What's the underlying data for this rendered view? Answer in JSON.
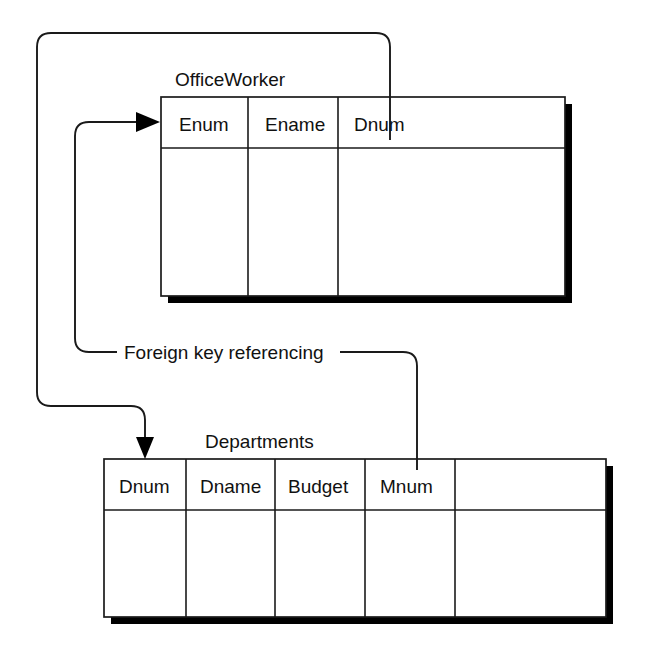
{
  "diagram": {
    "type": "relational-schema",
    "label_text": "Foreign key referencing",
    "line_color": "#1a1a1a",
    "shadow_color": "#000000",
    "background_color": "#ffffff"
  },
  "tables": [
    {
      "id": "officeworker",
      "name": "OfficeWorker",
      "columns": [
        {
          "name": "Enum",
          "is_key": true,
          "is_empty": false
        },
        {
          "name": "Ename",
          "is_key": false,
          "is_empty": false
        },
        {
          "name": "Dnum",
          "is_key": false,
          "is_empty": false
        }
      ]
    },
    {
      "id": "departments",
      "name": "Departments",
      "columns": [
        {
          "name": "Dnum",
          "is_key": true,
          "is_empty": false
        },
        {
          "name": "Dname",
          "is_key": false,
          "is_empty": false
        },
        {
          "name": "Budget",
          "is_key": false,
          "is_empty": false
        },
        {
          "name": "Mnum",
          "is_key": false,
          "is_empty": false
        },
        {
          "name": "",
          "is_key": false,
          "is_empty": true
        }
      ]
    }
  ],
  "relationships": [
    {
      "id": "dnum-fk",
      "from_table": "OfficeWorker",
      "from_column": "Dnum",
      "to_table": "Departments",
      "to_column": "Dnum",
      "label": "Foreign key referencing",
      "arrow_direction": "down"
    },
    {
      "id": "mnum-fk",
      "from_table": "Departments",
      "from_column": "Mnum",
      "to_table": "OfficeWorker",
      "to_column": "Enum",
      "label": "Foreign key referencing",
      "arrow_direction": "right"
    }
  ]
}
